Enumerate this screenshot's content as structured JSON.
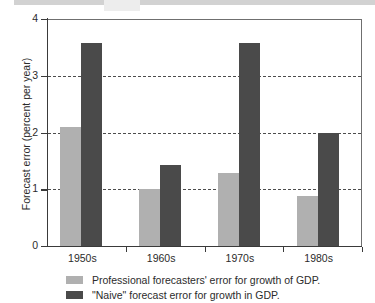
{
  "chart_data": {
    "type": "bar",
    "title": "",
    "xlabel": "",
    "ylabel": "Forecast error (percent per year)",
    "categories": [
      "1950s",
      "1960s",
      "1970s",
      "1980s"
    ],
    "series": [
      {
        "name": "Professional forecasters' error for growth of GDP.",
        "color": "#b0b0b0",
        "values": [
          2.1,
          1.0,
          1.28,
          0.88
        ]
      },
      {
        "name": "\"Naive\" forecast error for growth in GDP.",
        "color": "#4a4a4a",
        "values": [
          3.57,
          1.43,
          3.57,
          2.0
        ]
      }
    ],
    "ylim": [
      0,
      4
    ],
    "yticks": [
      "0",
      "1",
      "2",
      "3",
      "4"
    ],
    "gridlines": [
      1,
      2,
      3
    ],
    "grid": "horizontal-dashed",
    "legend_position": "bottom-left"
  },
  "legend": {
    "entries": [
      {
        "label": "Professional forecasters' error for growth of GDP."
      },
      {
        "label": "\"Naive\" forecast error for growth in GDP."
      }
    ]
  },
  "colors": {
    "light_bar": "#b0b0b0",
    "dark_bar": "#4a4a4a",
    "axis": "#3a3a3a",
    "background": "#ffffff"
  }
}
